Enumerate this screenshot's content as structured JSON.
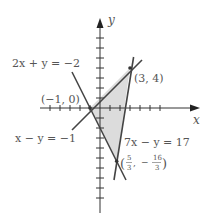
{
  "diagram": {
    "type": "system-of-linear-inequalities-graph",
    "axes": {
      "x_label": "x",
      "y_label": "y",
      "origin_px": [
        100,
        108
      ],
      "scale_px_per_unit": 10,
      "x_ticks": [
        -5,
        -4,
        -3,
        -2,
        -1,
        1,
        2,
        3,
        4,
        5,
        6
      ],
      "y_ticks": [
        -10,
        -9,
        -8,
        -7,
        -6,
        -5,
        -4,
        -3,
        -2,
        -1,
        1,
        2,
        3,
        4,
        5,
        6,
        7,
        8
      ]
    },
    "lines": [
      {
        "equation": "2x + y = −2",
        "label": "2x + y = −2"
      },
      {
        "equation": "x − y = −1",
        "label": "x − y = −1"
      },
      {
        "equation": "7x − y = 17",
        "label": "7x − y = 17"
      }
    ],
    "vertices": [
      {
        "label": "(−1, 0)",
        "x": -1,
        "y": 0
      },
      {
        "label": "(3, 4)",
        "x": 3,
        "y": 4
      },
      {
        "label_num_x": "5",
        "label_den_x": "3",
        "label_num_y": "16",
        "label_den_y": "3",
        "x": 1.6667,
        "y": -5.3333
      }
    ],
    "region_fill": "#d9d9d9",
    "line_color": "#444444",
    "axis_color": "#333333"
  }
}
